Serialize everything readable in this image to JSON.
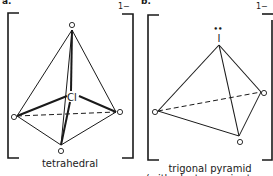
{
  "figure": {
    "panels": [
      {
        "part_label": "a.",
        "charge": "1−",
        "central_atom": "Cl",
        "ligand_atom": "O",
        "geometry_label": "tetrahedral"
      },
      {
        "part_label": "b.",
        "charge": "1−",
        "central_atom": "I",
        "lone_pair": "••",
        "ligand_atom": "O",
        "geometry_label": "trigonal pyramid",
        "geometry_sublabel": "(with electron pair at apex)"
      }
    ],
    "colors": {
      "ink": "#1a1a1a",
      "background": "#ffffff"
    }
  }
}
